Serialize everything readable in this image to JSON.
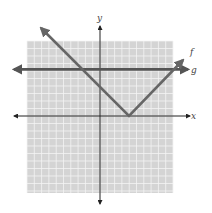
{
  "chart_data": {
    "type": "line",
    "title": "",
    "xlabel": "x",
    "ylabel": "y",
    "xlim": [
      -10,
      10
    ],
    "ylim": [
      -10,
      10
    ],
    "grid": true,
    "grid_step": 1,
    "series": [
      {
        "name": "f",
        "equation": "f(x) = |x - 4|",
        "points": [
          [
            -6,
            10
          ],
          [
            4,
            0
          ],
          [
            11,
            7
          ]
        ],
        "vertex": [
          4,
          0
        ]
      },
      {
        "name": "g",
        "equation": "g(x) = 6",
        "points": [
          [
            -13,
            6
          ],
          [
            12,
            6
          ]
        ]
      }
    ],
    "intersections": [
      [
        -2,
        6
      ],
      [
        10,
        6
      ]
    ],
    "colors": {
      "grid_bg": "#d4d4d4",
      "grid_line": "#f4f4f4",
      "axis": "#222222",
      "f": "#666666",
      "g": "#555555"
    }
  },
  "labels": {
    "x_axis": "x",
    "y_axis": "y",
    "f": "f",
    "g": "g"
  }
}
